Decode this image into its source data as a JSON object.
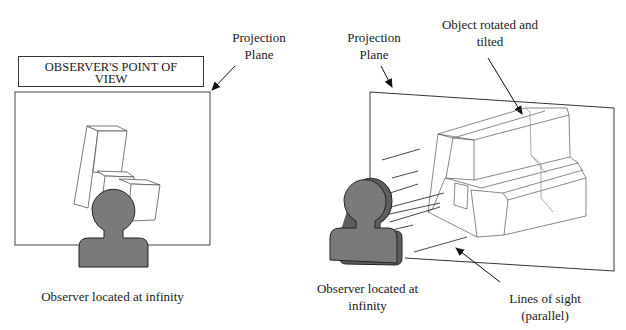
{
  "left_panel": {
    "title_box": {
      "line1": "OBSERVER'S POINT OF",
      "line2": "VIEW"
    },
    "projection_label": {
      "line1": "Projection",
      "line2": "Plane"
    },
    "caption": "Observer located at infinity"
  },
  "right_panel": {
    "projection_label": {
      "line1": "Projection",
      "line2": "Plane"
    },
    "object_label": {
      "line1": "Object rotated and",
      "line2": "tilted"
    },
    "observer_label": {
      "line1": "Observer located at",
      "line2": "infinity"
    },
    "sight_label": {
      "line1": "Lines of sight",
      "line2": "(parallel)"
    }
  },
  "colors": {
    "observer_fill": "#7a7a7a",
    "line": "#333333",
    "object_line": "#555555"
  }
}
